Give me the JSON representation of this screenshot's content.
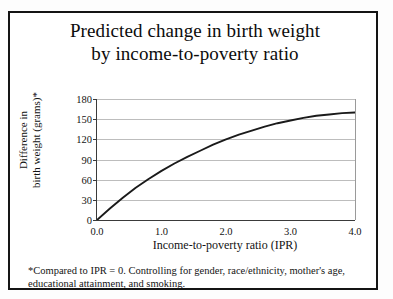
{
  "figure": {
    "title_line1": "Predicted change in birth weight",
    "title_line2": "by income-to-poverty ratio",
    "footnote_line1": "*Compared to IPR = 0. Controlling for gender, race/ethnicity, mother's age,",
    "footnote_line2": "educational attainment, and smoking.",
    "border_color": "#141414",
    "curve_color": "#1a1a1a",
    "grid_color": "#bdbdbd",
    "axis_color": "#3a3a3a"
  },
  "chart_data": {
    "type": "line",
    "title": "Predicted change in birth weight by income-to-poverty ratio",
    "xlabel": "Income-to-poverty ratio (IPR)",
    "ylabel_line1": "Difference in",
    "ylabel_line2": "birth weight (grams)*",
    "xlim": [
      0.0,
      4.0
    ],
    "ylim": [
      0,
      180
    ],
    "xticks": [
      "0.0",
      "1.0",
      "2.0",
      "3.0",
      "4.0"
    ],
    "xtick_values": [
      0.0,
      1.0,
      2.0,
      3.0,
      4.0
    ],
    "yticks": [
      "0",
      "30",
      "60",
      "90",
      "120",
      "150",
      "180"
    ],
    "ytick_values": [
      0,
      30,
      60,
      90,
      120,
      150,
      180
    ],
    "grid": "horizontal",
    "legend": "none",
    "series": [
      {
        "name": "Predicted difference in birth weight",
        "x": [
          0.0,
          0.2,
          0.4,
          0.6,
          0.8,
          1.0,
          1.2,
          1.4,
          1.6,
          1.8,
          2.0,
          2.2,
          2.4,
          2.6,
          2.8,
          3.0,
          3.2,
          3.4,
          3.6,
          3.8,
          4.0
        ],
        "values": [
          0,
          17,
          33,
          48,
          61,
          73,
          84,
          94,
          103,
          112,
          120,
          127,
          133,
          139,
          144,
          148,
          152,
          155,
          157,
          159,
          160
        ]
      }
    ]
  }
}
